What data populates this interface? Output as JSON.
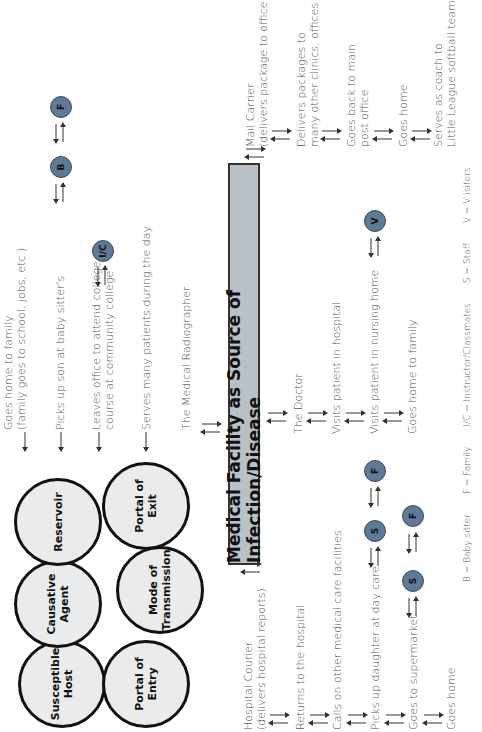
{
  "chain_of_infection": {
    "circles": [
      {
        "id": "causative-agent",
        "label": "Causative\nAgent"
      },
      {
        "id": "reservoir",
        "label": "Reservoir"
      },
      {
        "id": "portal-of-exit",
        "label": "Portal of\nExit"
      },
      {
        "id": "mode-of-transmission",
        "label": "Mode of\nTransmission"
      },
      {
        "id": "portal-of-entry",
        "label": "Portal of\nEntry"
      },
      {
        "id": "susceptible-host",
        "label": "Susceptible\nHost"
      }
    ]
  },
  "main_box": {
    "title": "Medical Facility as Source of Infection/Disease"
  },
  "hospital_courier": {
    "steps": [
      "Hospital Courier\n(delivers hospital reports)",
      "Returns to the hospital",
      "Calls on other medical care facilities",
      "Picks up daughter at day care",
      "Goes to supermarket",
      "Goes home"
    ],
    "nodes": [
      {
        "label": "S",
        "row": "daughter"
      },
      {
        "label": "F",
        "row": "daughter"
      },
      {
        "label": "S",
        "row": "supermarket"
      },
      {
        "label": "F",
        "row": "supermarket"
      }
    ]
  },
  "medical_radiographer": {
    "steps": [
      "The Medical Radiographer",
      "Serves many patients during the day",
      "Leaves office to attend college\ncourse at community college",
      "Picks up son at baby sitter's",
      "Goes home to family\n(family goes to school, jobs, etc.)"
    ],
    "nodes": [
      {
        "label": "I/C",
        "row": "college"
      },
      {
        "label": "B",
        "row": "babysitter"
      },
      {
        "label": "F",
        "row": "babysitter"
      }
    ]
  },
  "doctor": {
    "steps": [
      "The Doctor",
      "Visits patient in hospital",
      "Visits patient in nursing home",
      "Goes home to family"
    ],
    "nodes": [
      {
        "label": "V",
        "row": "nursing-home"
      }
    ]
  },
  "mail_carrier": {
    "steps": [
      "Mail Carrier\n(delivers package to office)",
      "Delivers packages to\nmany other clinics, offices",
      "Goes back to main\npost office",
      "Goes home",
      "Serves as coach to\nLittle League softball team"
    ]
  },
  "legend": {
    "items": [
      "B  =  Baby sitter",
      "F  =  Family",
      "I/C  =  Instructor/Classmates",
      "S  =  Staff",
      "V  =  V isitors"
    ]
  },
  "colors": {
    "circle_fill": "#e9ebec",
    "main_box_fill": "#b8c1c8",
    "node_fill": "#5f7a96",
    "text": "#555555"
  }
}
